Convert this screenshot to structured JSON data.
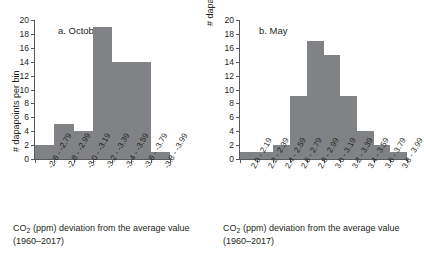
{
  "chart_data": [
    {
      "type": "bar",
      "title": "a. October",
      "categories": [
        "-2.6 - -2.79",
        "-2.8 - -2.99",
        "-3.0 - -3.19",
        "-3.2 - -3.39",
        "-3.4 - -3.59",
        "-3.6 - -3.79",
        "-3.8 - -3.99"
      ],
      "values": [
        2,
        5,
        4,
        19,
        14,
        14,
        1
      ],
      "xlabel": "CO2 (ppm) deviation from the average value (1960–2017)",
      "ylabel": "# dapapoints per bin",
      "ylim": [
        0,
        20
      ],
      "yticks": [
        0,
        2,
        4,
        6,
        8,
        10,
        12,
        14,
        16,
        18,
        20
      ],
      "grid": false,
      "legend": "none",
      "bar_color": "#808285"
    },
    {
      "type": "bar",
      "title": "b. May",
      "categories": [
        "2.0 - 2.19",
        "2.2 - 2.39",
        "2.4 - 2.59",
        "2.6 - 2.79",
        "2.8 - 2.99",
        "3.0 - 3.19",
        "3.2 - 3.39",
        "3.4 - 3.59",
        "3.6 - 3.79",
        "3.8 - 3.99"
      ],
      "values": [
        1,
        1,
        2,
        9,
        17,
        15,
        9,
        4,
        2,
        1
      ],
      "xlabel": "CO2 (ppm) deviation from the average value (1960–2017)",
      "ylabel": "# dapapoints per bin",
      "ylim": [
        0,
        20
      ],
      "yticks": [
        0,
        2,
        4,
        6,
        8,
        10,
        12,
        14,
        16,
        18,
        20
      ],
      "grid": false,
      "legend": "none",
      "bar_color": "#808285"
    }
  ],
  "panels": {
    "october": {
      "title": "a. October",
      "y_axis_title": "# dapapoints per bin",
      "x_axis_title_line1": "CO",
      "x_axis_title_sub": "2",
      "x_axis_title_line2": " (ppm) deviation from the average",
      "x_axis_title_line3": "value (1960–2017)"
    },
    "may": {
      "title": "b. May",
      "y_axis_title": "# dapapoints per bin",
      "x_axis_title_line1": "CO",
      "x_axis_title_sub": "2",
      "x_axis_title_line2": " (ppm) deviation from the average",
      "x_axis_title_line3": "value (1960–2017)"
    }
  }
}
